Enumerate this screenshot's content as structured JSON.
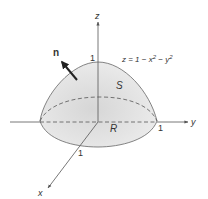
{
  "diagram": {
    "axes": {
      "x_label": "x",
      "y_label": "y",
      "z_label": "z"
    },
    "ticks": {
      "z_one": "1",
      "y_one": "1",
      "x_one": "1"
    },
    "surface_label": "S",
    "region_label": "R",
    "normal_label": "n",
    "equation": {
      "lhs": "z = 1 − x",
      "exp1": "2",
      "mid": " − y",
      "exp2": "2"
    },
    "colors": {
      "surface": "#e6e6e6",
      "line": "#555555",
      "text": "#333333"
    }
  }
}
